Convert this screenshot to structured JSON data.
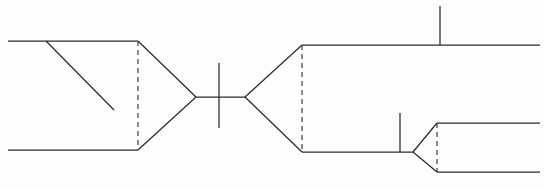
{
  "figure": {
    "background_color": "#fdfdfd",
    "stroke_color": "#2b2b2b",
    "dashed_stroke_color": "#3a3a3a",
    "width": 545,
    "height": 189
  },
  "chart_data": {
    "type": "line",
    "xlabel": "",
    "ylabel": "",
    "xlim": [
      0,
      545
    ],
    "ylim": [
      0,
      189
    ],
    "grid": false,
    "legend": null,
    "series": [
      {
        "name": "upper-left-rail",
        "style": "solid",
        "points": [
          [
            8,
            41
          ],
          [
            138,
            41
          ]
        ]
      },
      {
        "name": "lower-left-rail",
        "style": "solid",
        "points": [
          [
            8,
            150
          ],
          [
            138,
            150
          ]
        ]
      },
      {
        "name": "left-diagonal-stub",
        "style": "solid",
        "points": [
          [
            46,
            41
          ],
          [
            114,
            110
          ]
        ]
      },
      {
        "name": "left-funnel-upper",
        "style": "solid",
        "points": [
          [
            138,
            41
          ],
          [
            196,
            97
          ]
        ]
      },
      {
        "name": "left-funnel-lower",
        "style": "solid",
        "points": [
          [
            138,
            150
          ],
          [
            196,
            97
          ]
        ]
      },
      {
        "name": "center-axis",
        "style": "solid",
        "points": [
          [
            196,
            97
          ],
          [
            245,
            97
          ]
        ]
      },
      {
        "name": "right-funnel-upper",
        "style": "solid",
        "points": [
          [
            245,
            97
          ],
          [
            302,
            45
          ]
        ]
      },
      {
        "name": "right-funnel-lower",
        "style": "solid",
        "points": [
          [
            245,
            97
          ],
          [
            302,
            152
          ]
        ]
      },
      {
        "name": "upper-right-rail",
        "style": "solid",
        "points": [
          [
            302,
            45
          ],
          [
            540,
            45
          ]
        ]
      },
      {
        "name": "lower-right-rail",
        "style": "solid",
        "points": [
          [
            302,
            152
          ],
          [
            413,
            152
          ]
        ]
      },
      {
        "name": "branch-upper",
        "style": "solid",
        "points": [
          [
            413,
            152
          ],
          [
            437,
            123
          ]
        ]
      },
      {
        "name": "branch-lower",
        "style": "solid",
        "points": [
          [
            413,
            152
          ],
          [
            437,
            172
          ]
        ]
      },
      {
        "name": "branch-upper-rail",
        "style": "solid",
        "points": [
          [
            437,
            123
          ],
          [
            540,
            123
          ]
        ]
      },
      {
        "name": "branch-lower-rail",
        "style": "solid",
        "points": [
          [
            437,
            172
          ],
          [
            540,
            172
          ]
        ]
      }
    ],
    "dashed_segments": [
      {
        "name": "left-section-marker",
        "points": [
          [
            138,
            41
          ],
          [
            138,
            150
          ]
        ]
      },
      {
        "name": "right-section-marker",
        "points": [
          [
            302,
            45
          ],
          [
            302,
            152
          ]
        ]
      },
      {
        "name": "branch-section-marker",
        "points": [
          [
            437,
            123
          ],
          [
            437,
            172
          ]
        ]
      }
    ],
    "tick_marks": [
      {
        "name": "center-station-tick",
        "points": [
          [
            219,
            63
          ],
          [
            219,
            128
          ]
        ]
      },
      {
        "name": "upper-right-station-tick",
        "points": [
          [
            440,
            6
          ],
          [
            440,
            45
          ]
        ]
      },
      {
        "name": "lower-right-station-tick",
        "points": [
          [
            400,
            113
          ],
          [
            400,
            152
          ]
        ]
      }
    ]
  }
}
